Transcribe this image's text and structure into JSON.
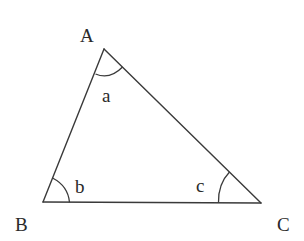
{
  "diagram": {
    "type": "triangle",
    "stroke_color": "#3a3a3a",
    "background": "#ffffff",
    "vertices": {
      "A": {
        "label": "A",
        "x": 104,
        "y": 49
      },
      "B": {
        "label": "B",
        "x": 43,
        "y": 202
      },
      "C": {
        "label": "C",
        "x": 261,
        "y": 203
      }
    },
    "angles": {
      "a": {
        "label": "a",
        "at_vertex": "A"
      },
      "b": {
        "label": "b",
        "at_vertex": "B"
      },
      "c": {
        "label": "c",
        "at_vertex": "C"
      }
    }
  }
}
